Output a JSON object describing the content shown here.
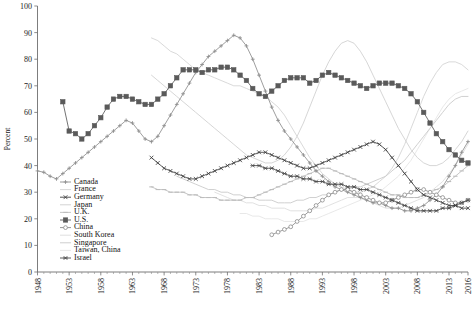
{
  "chart_data": {
    "type": "line",
    "title": "",
    "xlabel": "",
    "ylabel": "Percent",
    "ylim": [
      0,
      100
    ],
    "ytick_values": [
      0,
      10,
      20,
      30,
      40,
      50,
      60,
      70,
      80,
      90,
      100
    ],
    "xlim": [
      1948,
      2016
    ],
    "xtick_labels": [
      "1948",
      "1953",
      "1958",
      "1963",
      "1968",
      "1973",
      "1978",
      "1983",
      "1988",
      "1993",
      "1998",
      "2003",
      "2008",
      "2013",
      "2016"
    ],
    "xtick_years": [
      1948,
      1953,
      1958,
      1963,
      1968,
      1973,
      1978,
      1983,
      1988,
      1993,
      1998,
      2003,
      2008,
      2013,
      2016
    ],
    "grid": false,
    "legend_position": "inside-lower-left",
    "series": [
      {
        "name": "Canada",
        "color": "#8d8d8d",
        "marker": "plus",
        "start_year": 1948,
        "values": [
          38,
          37.5,
          36,
          35,
          37,
          39,
          41,
          43,
          45,
          47,
          49,
          51,
          53,
          55,
          57,
          56,
          53,
          50,
          49,
          51,
          55,
          59,
          63,
          67,
          71,
          75,
          78,
          81,
          83,
          85,
          87,
          89,
          88,
          85,
          80,
          74,
          68,
          62,
          57,
          53,
          50,
          47,
          44,
          41,
          38,
          36,
          34,
          32,
          31,
          30,
          29,
          28,
          27,
          26,
          26,
          25,
          24,
          24,
          23,
          23,
          24,
          25,
          27,
          29,
          32,
          36,
          40,
          45,
          49
        ]
      },
      {
        "name": "France",
        "color": "#d2d2d2",
        "marker": "none",
        "start_year": 1966,
        "values": [
          88,
          87,
          85,
          83,
          82,
          80,
          78,
          76,
          75,
          74,
          73,
          72,
          71,
          70,
          70,
          69,
          68,
          67,
          66,
          64,
          62,
          59,
          55,
          51,
          47,
          43,
          40,
          37,
          35,
          33,
          32,
          31,
          30,
          30,
          31,
          32,
          34,
          36,
          39,
          43,
          48,
          54,
          60,
          66,
          71,
          75,
          78,
          79,
          79,
          78,
          76,
          74,
          72
        ]
      },
      {
        "name": "Germany",
        "color": "#3d3d3d",
        "marker": "x",
        "start_year": 1966,
        "values": [
          43,
          41,
          39,
          38,
          37,
          36,
          35,
          35,
          36,
          37,
          38,
          39,
          40,
          41,
          42,
          43,
          44,
          45,
          45,
          44,
          43,
          42,
          41,
          40,
          39,
          39,
          40,
          41,
          42,
          43,
          44,
          45,
          46,
          47,
          48,
          49,
          48,
          46,
          43,
          40,
          37,
          34,
          31,
          29,
          28,
          27,
          26,
          25,
          25,
          24,
          24,
          23,
          23,
          23,
          24,
          25,
          26,
          28,
          30,
          32,
          34,
          36,
          38,
          40,
          42,
          44,
          46,
          47,
          48
        ]
      },
      {
        "name": "Japan",
        "color": "#cfcfcf",
        "marker": "none",
        "start_year": 1966,
        "values": [
          74,
          72,
          70,
          68,
          66,
          64,
          62,
          60,
          58,
          56,
          54,
          52,
          50,
          48,
          46,
          44,
          43,
          42,
          41,
          41,
          42,
          44,
          47,
          51,
          56,
          62,
          68,
          74,
          79,
          83,
          86,
          87,
          86,
          83,
          79,
          74,
          69,
          64,
          59,
          54,
          50,
          46,
          43,
          41,
          40,
          40,
          41,
          43,
          46,
          49,
          53,
          57,
          61,
          65,
          68,
          71,
          73,
          74,
          74,
          73,
          71,
          69,
          67,
          65,
          63,
          61,
          59,
          58,
          57
        ]
      },
      {
        "name": "U.K.",
        "color": "#bdbdbd",
        "marker": "dash",
        "start_year": 1966,
        "values": [
          32,
          31,
          31,
          30,
          30,
          30,
          29,
          29,
          28,
          28,
          28,
          27,
          27,
          27,
          27,
          28,
          28,
          29,
          30,
          31,
          32,
          33,
          34,
          35,
          36,
          37,
          38,
          39,
          39,
          38,
          37,
          36,
          35,
          34,
          33,
          32,
          31,
          30,
          29,
          29,
          28,
          28,
          28,
          29,
          30,
          31,
          32,
          34,
          36,
          38,
          40,
          42,
          44,
          46,
          48,
          50,
          52,
          54,
          56,
          57,
          58,
          59,
          60,
          61,
          62,
          63,
          64,
          65,
          66
        ]
      },
      {
        "name": "U.S.",
        "color": "#5a5a5a",
        "marker": "square",
        "start_year": 1952,
        "values": [
          64,
          53,
          52,
          50,
          52,
          55,
          58,
          62,
          65,
          66,
          66,
          65,
          64,
          63,
          63,
          65,
          67,
          70,
          73,
          76,
          76,
          76,
          75,
          76,
          76,
          77,
          77,
          76,
          74,
          72,
          69,
          67,
          66,
          68,
          70,
          72,
          73,
          73,
          73,
          71,
          72,
          74,
          75,
          74,
          73,
          72,
          71,
          70,
          69,
          70,
          71,
          71,
          71,
          70,
          69,
          67,
          64,
          60,
          56,
          52,
          49,
          46,
          44,
          42,
          41,
          41,
          42,
          45,
          48,
          49,
          49,
          49,
          49
        ]
      },
      {
        "name": "China",
        "color": "#8a8a8a",
        "marker": "circle",
        "start_year": 1985,
        "values": [
          14,
          15,
          16,
          17,
          19,
          21,
          23,
          25,
          27,
          29,
          30,
          31,
          31,
          30,
          29,
          28,
          27,
          26,
          26,
          27,
          28,
          29,
          30,
          31,
          31,
          30,
          29,
          28,
          27,
          26,
          26,
          27
        ]
      },
      {
        "name": "South Korea",
        "color": "#dcdcdc",
        "marker": "none",
        "start_year": 1976,
        "values": [
          30,
          29,
          28,
          27,
          27,
          26,
          26,
          25,
          25,
          24,
          24,
          24,
          23,
          23,
          23,
          23,
          24,
          24,
          25,
          26,
          27,
          28,
          28,
          28,
          27,
          26,
          25,
          24,
          24,
          24,
          25,
          26,
          27,
          28,
          30,
          32,
          34,
          37,
          40,
          44,
          48,
          52,
          56,
          60,
          64,
          67,
          69,
          70,
          70,
          69,
          68
        ]
      },
      {
        "name": "Singapore",
        "color": "#c8c8c8",
        "marker": "none",
        "start_year": 1970,
        "values": [
          36,
          35,
          34,
          33,
          32,
          31,
          31,
          30,
          30,
          29,
          29,
          28,
          28,
          27,
          27,
          27,
          26,
          26,
          26,
          27,
          27,
          28,
          28,
          29,
          29,
          30,
          31,
          31,
          32,
          32,
          33,
          34,
          35,
          36,
          38,
          40,
          42,
          45,
          48,
          51,
          54,
          57,
          60,
          63,
          65,
          66,
          66
        ]
      },
      {
        "name": "Taiwan, China",
        "color": "#e4e4e4",
        "marker": "none",
        "start_year": 1980,
        "values": [
          22,
          22,
          21,
          21,
          20,
          20,
          20,
          19,
          19,
          19,
          19,
          20,
          20,
          21,
          22,
          23,
          24,
          25,
          26,
          27,
          28,
          29,
          30,
          32,
          34,
          36,
          39,
          42,
          46,
          50,
          54,
          58,
          62,
          65,
          67,
          68,
          69,
          69
        ]
      },
      {
        "name": "Israel",
        "color": "#4a4a4a",
        "marker": "xdash",
        "start_year": 1982,
        "values": [
          40,
          40,
          39,
          39,
          38,
          37,
          36,
          36,
          35,
          35,
          34,
          34,
          33,
          33,
          33,
          32,
          32,
          31,
          31,
          30,
          29,
          28,
          27,
          26,
          25,
          24,
          23,
          23,
          23,
          23,
          24,
          24,
          25,
          26,
          27
        ]
      }
    ]
  },
  "legend": {
    "items": [
      {
        "label": "Canada"
      },
      {
        "label": "France"
      },
      {
        "label": "Germany"
      },
      {
        "label": "Japan"
      },
      {
        "label": "U.K."
      },
      {
        "label": "U.S."
      },
      {
        "label": "China"
      },
      {
        "label": "South Korea"
      },
      {
        "label": "Singapore"
      },
      {
        "label": "Taiwan, China"
      },
      {
        "label": "Israel"
      }
    ]
  }
}
